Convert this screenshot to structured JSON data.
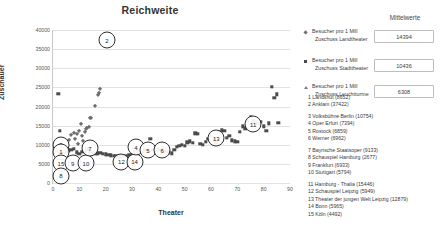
{
  "chart_data": {
    "type": "scatter",
    "title": "Reichweite",
    "xlabel": "Theater",
    "ylabel": "Zuschauer",
    "xlim": [
      0,
      90
    ],
    "ylim": [
      0,
      40000
    ],
    "xticks": [
      0,
      10,
      20,
      30,
      40,
      50,
      60,
      70,
      80,
      90
    ],
    "yticks": [
      0,
      5000,
      10000,
      15000,
      20000,
      25000,
      30000,
      35000,
      40000
    ],
    "grid": true,
    "legend_position": "right",
    "series": [
      {
        "name": "Besucher pro 1 Mill Zuschuss Landtheater",
        "marker": "diamond",
        "mean": 14394,
        "points": [
          [
            6,
            11300
          ],
          [
            7,
            12600
          ],
          [
            8,
            13000
          ],
          [
            9,
            12900
          ],
          [
            10,
            13600
          ],
          [
            10.5,
            15500
          ],
          [
            11,
            12300
          ],
          [
            12,
            13300
          ],
          [
            12.5,
            14100
          ],
          [
            13,
            14300
          ],
          [
            13.5,
            14600
          ],
          [
            14,
            17000
          ],
          [
            14.5,
            17100
          ],
          [
            16,
            20200
          ],
          [
            17,
            22900
          ],
          [
            17.5,
            23600
          ],
          [
            18,
            24500
          ],
          [
            11.5,
            10900
          ],
          [
            9.5,
            10300
          ],
          [
            8.5,
            11500
          ]
        ]
      },
      {
        "name": "Besucher pro 1 Mill Zuschuss Stadttheater",
        "marker": "square",
        "mean": 10436,
        "points": [
          [
            2,
            23300
          ],
          [
            2.5,
            13700
          ],
          [
            3,
            9900
          ],
          [
            4,
            8300
          ],
          [
            5,
            8200
          ],
          [
            6,
            8500
          ],
          [
            7,
            8600
          ],
          [
            8,
            9000
          ],
          [
            9,
            8000
          ],
          [
            10,
            7600
          ],
          [
            11,
            8100
          ],
          [
            12,
            8200
          ],
          [
            13,
            8800
          ],
          [
            14,
            8300
          ],
          [
            15,
            7900
          ],
          [
            16,
            7700
          ],
          [
            17,
            7800
          ],
          [
            18,
            7900
          ],
          [
            19,
            7600
          ],
          [
            20,
            7500
          ],
          [
            21,
            7300
          ],
          [
            22,
            7200
          ],
          [
            23,
            7100
          ],
          [
            24,
            7000
          ],
          [
            25,
            6900
          ],
          [
            26,
            7000
          ],
          [
            27,
            7100
          ],
          [
            28,
            7000
          ],
          [
            29,
            7200
          ],
          [
            30,
            7400
          ],
          [
            31,
            8000
          ],
          [
            32,
            8300
          ],
          [
            33,
            8200
          ],
          [
            34,
            8100
          ],
          [
            35,
            8600
          ],
          [
            36,
            8500
          ],
          [
            37,
            11600
          ],
          [
            38,
            8700
          ],
          [
            39,
            8600
          ],
          [
            40,
            8800
          ],
          [
            41,
            8600
          ],
          [
            42,
            8500
          ],
          [
            43,
            8200
          ],
          [
            44,
            8000
          ],
          [
            45,
            7800
          ],
          [
            46,
            8700
          ],
          [
            47,
            9400
          ],
          [
            48,
            9800
          ],
          [
            49,
            10000
          ],
          [
            50,
            9700
          ],
          [
            51,
            10600
          ],
          [
            52,
            10900
          ],
          [
            53,
            10500
          ],
          [
            54,
            13000
          ],
          [
            55,
            12900
          ],
          [
            56,
            10300
          ],
          [
            57,
            10000
          ],
          [
            58,
            10700
          ],
          [
            59,
            11500
          ],
          [
            60,
            12300
          ],
          [
            61,
            11400
          ],
          [
            62,
            10500
          ],
          [
            63,
            13400
          ],
          [
            64,
            13800
          ],
          [
            65,
            13600
          ],
          [
            66,
            11800
          ],
          [
            67,
            12300
          ],
          [
            68,
            11200
          ],
          [
            69,
            10900
          ],
          [
            70,
            10700
          ],
          [
            71,
            13400
          ],
          [
            72,
            14800
          ],
          [
            73,
            14300
          ],
          [
            74,
            16300
          ],
          [
            75,
            17300
          ],
          [
            76,
            16100
          ],
          [
            77,
            15900
          ],
          [
            78,
            15400
          ],
          [
            79,
            16000
          ],
          [
            80,
            14800
          ],
          [
            81,
            13600
          ],
          [
            82,
            15600
          ],
          [
            83,
            25100
          ],
          [
            84,
            22200
          ],
          [
            85,
            23200
          ],
          [
            85.5,
            15700
          ]
        ]
      },
      {
        "name": "Besucher pro 1 Mill Zuschuss Leuchtturme",
        "marker": "triangle",
        "mean": 6308,
        "points": []
      }
    ],
    "callouts": [
      {
        "label": "2",
        "x": 20.5,
        "y": 37300
      },
      {
        "label": "3",
        "x": 3,
        "y": 10000
      },
      {
        "label": "1",
        "x": 3,
        "y": 8200
      },
      {
        "label": "15",
        "x": 3,
        "y": 5200
      },
      {
        "label": "8",
        "x": 3,
        "y": 1900
      },
      {
        "label": "9",
        "x": 7.5,
        "y": 5200
      },
      {
        "label": "10",
        "x": 12.5,
        "y": 5100
      },
      {
        "label": "7",
        "x": 14,
        "y": 9100
      },
      {
        "label": "12",
        "x": 26,
        "y": 5500
      },
      {
        "label": "14",
        "x": 31,
        "y": 5500
      },
      {
        "label": "4",
        "x": 31.5,
        "y": 9400
      },
      {
        "label": "5",
        "x": 36,
        "y": 8500
      },
      {
        "label": "6",
        "x": 41.5,
        "y": 8500
      },
      {
        "label": "13",
        "x": 62,
        "y": 11700
      },
      {
        "label": "11",
        "x": 76,
        "y": 15300
      }
    ]
  },
  "side_panel": {
    "mittelwerte_header": "Mittelwerte",
    "legend": [
      {
        "marker": "diamond-marker",
        "line1": "Besucher pro 1 Mill",
        "line2": "Zuschuss Landtheater",
        "value": "14394"
      },
      {
        "marker": "square-marker",
        "line1": "Besucher pro 1 Mill",
        "line2": "Zuschuss Stadttheater",
        "value": "10436"
      },
      {
        "marker": "triangle-marker",
        "line1": "Besucher pro 1 Mill",
        "line2": "Zuschuss Leuchtturme",
        "value": "6308"
      }
    ],
    "city_groups": [
      [
        "1 Landshut (8652)",
        "2 Anklam (37422)"
      ],
      [
        "3 Volksbühne Berlin (10754)",
        "4 Oper Erfurt (7394)",
        "5  Rostock (6859)",
        "6 Werner (6962)"
      ],
      [
        "7 Bayrische Staatsoper (9133)",
        "8 Schauspiel Hamburg (2677)",
        "9 Frankfurt (6933)",
        "10 Stuttgart (5794)"
      ],
      [
        "11 Hamburg - Thalia (15446)",
        "12 Schauspiel Leipzig (5949)",
        "13 Theater der jungen Welt Leipzig (12879)",
        "14 Bonn (5965)",
        "15 Köln (4492)"
      ]
    ]
  }
}
